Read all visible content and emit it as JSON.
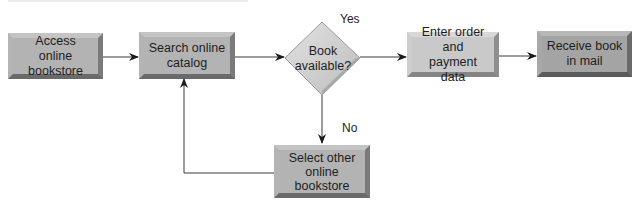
{
  "diagram": {
    "type": "flowchart",
    "nodes": {
      "access": {
        "label": "Access online bookstore",
        "line1": "Access online",
        "line2": "bookstore",
        "shape": "process"
      },
      "search": {
        "label": "Search online catalog",
        "line1": "Search online",
        "line2": "catalog",
        "shape": "process"
      },
      "decision": {
        "label": "Book available?",
        "line1": "Book",
        "line2": "available?",
        "shape": "decision"
      },
      "order": {
        "label": "Enter order and payment data",
        "line1": "Enter order and",
        "line2": "payment data",
        "shape": "process"
      },
      "receive": {
        "label": "Receive book in mail",
        "line1": "Receive book",
        "line2": "in mail",
        "shape": "process"
      },
      "other": {
        "label": "Select other online bookstore",
        "line1": "Select other",
        "line2": "online",
        "line3": "bookstore",
        "shape": "process"
      }
    },
    "edges": [
      {
        "from": "access",
        "to": "search",
        "label": ""
      },
      {
        "from": "search",
        "to": "decision",
        "label": ""
      },
      {
        "from": "decision",
        "to": "order",
        "label": "Yes"
      },
      {
        "from": "order",
        "to": "receive",
        "label": ""
      },
      {
        "from": "decision",
        "to": "other",
        "label": "No"
      },
      {
        "from": "other",
        "to": "search",
        "label": ""
      }
    ],
    "edge_labels": {
      "yes": "Yes",
      "no": "No"
    },
    "colors": {
      "line": "#3a3a3a",
      "box_fill": "#b3b3b3",
      "diamond_fill": "#cfcfcf",
      "text": "#1e1e1e"
    }
  }
}
